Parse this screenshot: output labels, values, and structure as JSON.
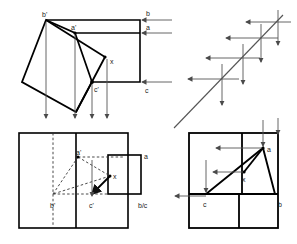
{
  "figure": {
    "background_color": "#ffffff",
    "line_color": "#000000",
    "thin_line_color": "#555555",
    "dash_color": "#333333",
    "width": 297,
    "height": 244
  },
  "panels": [
    {
      "id": "top-left",
      "name": "rotated-square-projection-panel",
      "labels": [
        {
          "key": "b_prime",
          "text": "b'",
          "x": 46,
          "y": 19
        },
        {
          "key": "a_prime",
          "text": "a'",
          "x": 75,
          "y": 32
        },
        {
          "key": "x",
          "text": "x",
          "x": 111,
          "y": 64
        },
        {
          "key": "c_prime",
          "text": "c'",
          "x": 95,
          "y": 91
        },
        {
          "key": "b_right",
          "text": "b",
          "x": 146,
          "y": 17
        },
        {
          "key": "a_right",
          "text": "a",
          "x": 146,
          "y": 31
        },
        {
          "key": "c_right",
          "text": "c",
          "x": 145,
          "y": 91
        }
      ],
      "arrow_count_down": 4,
      "arrow_count_left": 3
    },
    {
      "id": "top-right",
      "name": "diagonal-line-arrow-panel",
      "labels": [],
      "cross_points": 4,
      "arrow_count_down": 4,
      "arrow_count_left": 4
    },
    {
      "id": "bottom-left",
      "name": "front-view-construction-panel",
      "labels": [
        {
          "key": "a_prime",
          "text": "a'",
          "x": 79,
          "y": 155
        },
        {
          "key": "x",
          "text": "x",
          "x": 114,
          "y": 178
        },
        {
          "key": "b_prime",
          "text": "b'",
          "x": 54,
          "y": 206
        },
        {
          "key": "c_prime",
          "text": "c'",
          "x": 93,
          "y": 206
        },
        {
          "key": "a_side",
          "text": "a",
          "x": 144,
          "y": 158
        },
        {
          "key": "bc_side",
          "text": "b/c",
          "x": 141,
          "y": 206
        }
      ],
      "arrow_count_down": 1,
      "dashed": true
    },
    {
      "id": "bottom-right",
      "name": "top-view-triangle-panel",
      "labels": [
        {
          "key": "a",
          "text": "a",
          "x": 265,
          "y": 155
        },
        {
          "key": "x",
          "text": "x",
          "x": 243,
          "y": 180
        },
        {
          "key": "c",
          "text": "c",
          "x": 219,
          "y": 207
        },
        {
          "key": "b",
          "text": "b",
          "x": 281,
          "y": 207
        }
      ],
      "arrow_count_down": 3,
      "arrow_count_left": 3
    }
  ],
  "legend": {
    "point_labels": [
      "b'",
      "a'",
      "c'",
      "x",
      "a",
      "b",
      "c",
      "b/c"
    ]
  }
}
